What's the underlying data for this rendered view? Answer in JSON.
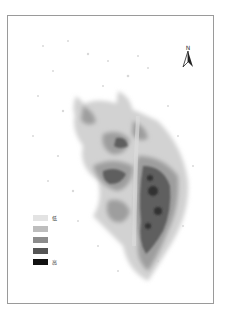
{
  "map": {
    "north_arrow": {
      "label": "N"
    },
    "legend": {
      "items": [
        {
          "color": "#e3e3e3",
          "label": "低"
        },
        {
          "color": "#bdbdbd",
          "label": ""
        },
        {
          "color": "#8c8c8c",
          "label": ""
        },
        {
          "color": "#555555",
          "label": ""
        },
        {
          "color": "#111111",
          "label": "高"
        }
      ]
    },
    "colors": {
      "frame": "#9a9a9a",
      "low": "#e3e3e3",
      "high": "#111111"
    }
  }
}
